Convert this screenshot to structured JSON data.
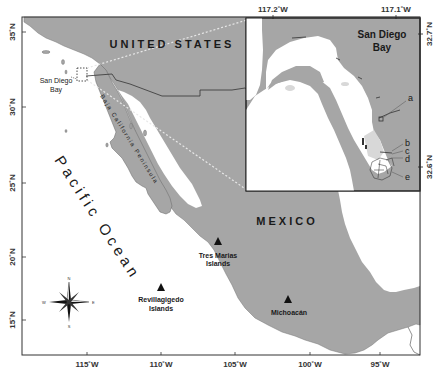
{
  "figure": {
    "type": "map",
    "frame": {
      "left": 22,
      "top": 17,
      "right": 420,
      "bottom": 355
    }
  },
  "main_map": {
    "country_labels": {
      "usa": "UNITED STATES",
      "mexico": "MEXICO"
    },
    "water_labels": {
      "pacific": "Pacific Ocean"
    },
    "region_labels": {
      "baja": "Baja California Peninsula"
    },
    "sites": [
      {
        "name": "San Diego Bay",
        "line1": "San Diego",
        "line2": "Bay",
        "marker": "dashed-box"
      },
      {
        "name": "Tres Marias Islands",
        "line1": "Tres Marias",
        "line2": "Islands",
        "marker": "triangle"
      },
      {
        "name": "Revillagigedo Islands",
        "line1": "Revillagigedo",
        "line2": "Islands",
        "marker": "triangle"
      },
      {
        "name": "Michoacán",
        "line1": "Michoacán",
        "line2": "",
        "marker": "triangle"
      }
    ],
    "x_ticks": [
      "115˚W",
      "110˚W",
      "105˚W",
      "100˚W",
      "95˚W"
    ],
    "y_ticks": [
      "35˚N",
      "30˚N",
      "25˚N",
      "20˚N",
      "15˚N"
    ],
    "compass": {
      "n": "N",
      "s": "S",
      "e": "E",
      "w": "W",
      "ne": "NE",
      "nw": "NW",
      "se": "SE",
      "sw": "SW"
    }
  },
  "inset": {
    "title_line1": "San Diego",
    "title_line2": "Bay",
    "x_ticks": [
      "117.2˚W",
      "117.1˚W"
    ],
    "y_ticks": [
      "32.7˚N",
      "32.6˚N"
    ],
    "site_labels": [
      "a",
      "b",
      "c",
      "d",
      "e"
    ]
  },
  "colors": {
    "land": "#a6a6a6",
    "water": "#ffffff",
    "frame": "#333333",
    "border": "#444444",
    "connector": "#e8e8e8"
  }
}
